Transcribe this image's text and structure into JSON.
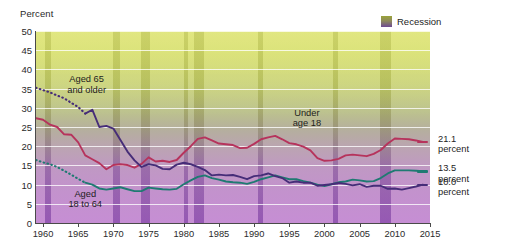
{
  "chart_data": {
    "type": "line",
    "title": "",
    "subtitle": "",
    "ylabel": "Percent",
    "xlabel": "",
    "ylim": [
      0,
      50
    ],
    "xlim": [
      1959,
      2015
    ],
    "ytick_labels": [
      "50",
      "45",
      "40",
      "35",
      "30",
      "25",
      "20",
      "15",
      "10",
      "5",
      "0"
    ],
    "ytick_values": [
      50,
      45,
      40,
      35,
      30,
      25,
      20,
      15,
      10,
      5,
      0
    ],
    "xtick_labels": [
      "1960",
      "1965",
      "1970",
      "1975",
      "1980",
      "1985",
      "1990",
      "1995",
      "2000",
      "2005",
      "2010",
      "2015"
    ],
    "xtick_values": [
      1960,
      1965,
      1970,
      1975,
      1980,
      1985,
      1990,
      1995,
      2000,
      2005,
      2010,
      2015
    ],
    "grid": true,
    "legend_position": "top-right",
    "legend": [
      {
        "label": "Recession",
        "swatch": "gradient-olive-purple"
      }
    ],
    "annotations": [
      {
        "text": "Aged 65\nand older",
        "series": "aged_65_and_older",
        "x": 1966,
        "y": 36
      },
      {
        "text": "Under\nage 18",
        "series": "under_age_18",
        "x": 1997,
        "y": 27
      },
      {
        "text": "Aged\n18 to 64",
        "series": "aged_18_to_64",
        "x": 1966,
        "y": 6
      }
    ],
    "end_labels": [
      {
        "text": "21.1\npercent",
        "value": 21.1,
        "series": "under_age_18",
        "color": "#b6335c"
      },
      {
        "text": "13.5\npercent",
        "value": 13.5,
        "series": "aged_18_to_64",
        "color": "#1f7a72"
      },
      {
        "text": "10.0\npercent",
        "value": 10.0,
        "series": "aged_65_and_older",
        "color": "#462d78"
      }
    ],
    "series": [
      {
        "name": "under_age_18",
        "label": "Under age 18",
        "color": "#b6335c",
        "style": "solid",
        "x": [
          1959,
          1960,
          1961,
          1962,
          1963,
          1964,
          1965,
          1966,
          1967,
          1968,
          1969,
          1970,
          1971,
          1972,
          1973,
          1974,
          1975,
          1976,
          1977,
          1978,
          1979,
          1980,
          1981,
          1982,
          1983,
          1984,
          1985,
          1986,
          1987,
          1988,
          1989,
          1990,
          1991,
          1992,
          1993,
          1994,
          1995,
          1996,
          1997,
          1998,
          1999,
          2000,
          2001,
          2002,
          2003,
          2004,
          2005,
          2006,
          2007,
          2008,
          2009,
          2010,
          2011,
          2012,
          2013,
          2014
        ],
        "values": [
          27.3,
          26.9,
          25.6,
          25.0,
          23.1,
          23.0,
          21.0,
          17.6,
          16.6,
          15.6,
          14.0,
          15.1,
          15.3,
          15.1,
          14.4,
          15.4,
          17.1,
          16.0,
          16.2,
          15.9,
          16.4,
          18.3,
          20.0,
          21.9,
          22.3,
          21.5,
          20.7,
          20.5,
          20.3,
          19.5,
          19.6,
          20.6,
          21.8,
          22.3,
          22.7,
          21.8,
          20.8,
          20.5,
          19.9,
          18.9,
          16.9,
          16.2,
          16.3,
          16.7,
          17.6,
          17.8,
          17.6,
          17.4,
          18.0,
          19.0,
          20.7,
          22.0,
          21.9,
          21.8,
          21.5,
          21.1
        ]
      },
      {
        "name": "aged_18_to_64",
        "label": "Aged 18 to 64",
        "color": "#1f7a72",
        "style": "solid",
        "x": [
          1966,
          1967,
          1968,
          1969,
          1970,
          1971,
          1972,
          1973,
          1974,
          1975,
          1976,
          1977,
          1978,
          1979,
          1980,
          1981,
          1982,
          1983,
          1984,
          1985,
          1986,
          1987,
          1988,
          1989,
          1990,
          1991,
          1992,
          1993,
          1994,
          1995,
          1996,
          1997,
          1998,
          1999,
          2000,
          2001,
          2002,
          2003,
          2004,
          2005,
          2006,
          2007,
          2008,
          2009,
          2010,
          2011,
          2012,
          2013,
          2014
        ],
        "values": [
          10.5,
          10.0,
          9.0,
          8.7,
          9.0,
          9.3,
          8.8,
          8.3,
          8.3,
          9.2,
          9.0,
          8.8,
          8.7,
          8.9,
          10.1,
          11.1,
          12.0,
          12.4,
          11.7,
          11.3,
          10.8,
          10.6,
          10.5,
          10.2,
          10.7,
          11.4,
          11.9,
          12.4,
          11.9,
          11.4,
          11.4,
          10.9,
          10.5,
          10.0,
          9.6,
          10.1,
          10.6,
          10.8,
          11.3,
          11.1,
          10.8,
          10.9,
          11.7,
          12.9,
          13.7,
          13.7,
          13.7,
          13.6,
          13.5
        ]
      },
      {
        "name": "aged_65_and_older",
        "label": "Aged 65 and older",
        "color": "#462d78",
        "style": "solid",
        "x": [
          1966,
          1967,
          1968,
          1969,
          1970,
          1971,
          1972,
          1973,
          1974,
          1975,
          1976,
          1977,
          1978,
          1979,
          1980,
          1981,
          1982,
          1983,
          1984,
          1985,
          1986,
          1987,
          1988,
          1989,
          1990,
          1991,
          1992,
          1993,
          1994,
          1995,
          1996,
          1997,
          1998,
          1999,
          2000,
          2001,
          2002,
          2003,
          2004,
          2005,
          2006,
          2007,
          2008,
          2009,
          2010,
          2011,
          2012,
          2013,
          2014
        ],
        "values": [
          28.5,
          29.5,
          25.0,
          25.3,
          24.6,
          21.6,
          18.6,
          16.3,
          14.6,
          15.3,
          15.0,
          14.1,
          14.0,
          15.2,
          15.7,
          15.3,
          14.6,
          13.8,
          12.4,
          12.6,
          12.4,
          12.5,
          12.0,
          11.4,
          12.2,
          12.4,
          12.9,
          12.2,
          11.7,
          10.5,
          10.8,
          10.5,
          10.5,
          9.7,
          9.9,
          10.1,
          10.4,
          10.2,
          9.8,
          10.1,
          9.4,
          9.7,
          9.7,
          8.9,
          9.0,
          8.7,
          9.1,
          9.5,
          10.0
        ]
      },
      {
        "name": "aged_65_and_older_dotted",
        "label": "Aged 65 and older (estimated)",
        "color": "#462d78",
        "style": "dotted",
        "x": [
          1959,
          1960,
          1961,
          1962,
          1963,
          1964,
          1965,
          1966
        ],
        "values": [
          35.2,
          34.6,
          34.0,
          33.2,
          32.5,
          31.3,
          30.2,
          28.5
        ]
      },
      {
        "name": "aged_18_to_64_dotted",
        "label": "Aged 18 to 64 (estimated)",
        "color": "#1f7a72",
        "style": "dotted",
        "x": [
          1959,
          1960,
          1961,
          1962,
          1963,
          1964,
          1965,
          1966
        ],
        "values": [
          16.4,
          15.8,
          15.3,
          14.6,
          13.6,
          12.6,
          11.5,
          10.5
        ]
      }
    ],
    "recessions": [
      {
        "start": 1960.3,
        "end": 1961.2
      },
      {
        "start": 1969.9,
        "end": 1970.9
      },
      {
        "start": 1973.9,
        "end": 1975.2
      },
      {
        "start": 1980.0,
        "end": 1980.6
      },
      {
        "start": 1981.5,
        "end": 1982.9
      },
      {
        "start": 1990.5,
        "end": 1991.2
      },
      {
        "start": 2001.2,
        "end": 2001.9
      },
      {
        "start": 2007.9,
        "end": 2009.5
      }
    ]
  }
}
